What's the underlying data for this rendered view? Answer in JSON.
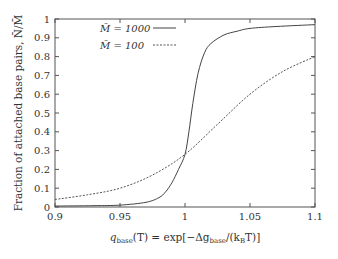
{
  "chart_data": {
    "type": "line",
    "title": "",
    "xlabel": "q_base(T) = exp[−Δg_base/(k_B T)]",
    "ylabel": "Fraction of attached base pairs, N̄/M̄",
    "xlim": [
      0.9,
      1.1
    ],
    "ylim": [
      0,
      1
    ],
    "xticks": [
      "0.9",
      "0.95",
      "1",
      "1.05",
      "1.1"
    ],
    "yticks": [
      "0",
      "0.1",
      "0.2",
      "0.3",
      "0.4",
      "0.5",
      "0.6",
      "0.7",
      "0.8",
      "0.9",
      "1"
    ],
    "grid": false,
    "legend_position": "upper-left",
    "series": [
      {
        "name": "M̄ = 1000",
        "style": "solid",
        "x": [
          0.9,
          0.93,
          0.95,
          0.97,
          0.98,
          0.985,
          0.99,
          0.995,
          1.0,
          1.003,
          1.006,
          1.01,
          1.015,
          1.02,
          1.03,
          1.04,
          1.05,
          1.07,
          1.1
        ],
        "y": [
          0.005,
          0.007,
          0.01,
          0.025,
          0.05,
          0.08,
          0.13,
          0.2,
          0.28,
          0.4,
          0.55,
          0.71,
          0.82,
          0.87,
          0.915,
          0.935,
          0.95,
          0.96,
          0.97
        ]
      },
      {
        "name": "M̄ = 100",
        "style": "dashed",
        "x": [
          0.9,
          0.925,
          0.95,
          0.975,
          1.0,
          1.025,
          1.05,
          1.075,
          1.1
        ],
        "y": [
          0.04,
          0.065,
          0.1,
          0.17,
          0.28,
          0.44,
          0.6,
          0.72,
          0.8
        ]
      }
    ]
  },
  "labels": {
    "xlabel_main": "q",
    "xlabel_sub": "base",
    "xlabel_rest1": "(T) = exp[−Δg",
    "xlabel_sub2": "base",
    "xlabel_rest2": "/(k",
    "xlabel_sub3": "B",
    "xlabel_rest3": "T)]",
    "ylabel": "Fraction of attached base pairs, N̄/M̄",
    "legend_1000": "M̄ = 1000",
    "legend_100": "M̄ = 100"
  }
}
